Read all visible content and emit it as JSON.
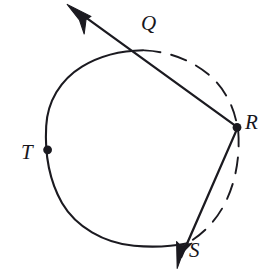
{
  "figure": {
    "name": "circle-with-two-secant-rays",
    "background_color": "#ffffff",
    "stroke_color": "#1b1a20",
    "labels": {
      "Q": "Q",
      "R": "R",
      "T": "T",
      "S": "S"
    },
    "points": [
      {
        "id": "Q",
        "label": "Q",
        "x": 143,
        "y": 51,
        "marked": false,
        "on_circle": true
      },
      {
        "id": "R",
        "label": "R",
        "x": 237,
        "y": 127,
        "marked": true,
        "on_circle": true
      },
      {
        "id": "T",
        "label": "T",
        "x": 48,
        "y": 150,
        "marked": true,
        "on_circle": true
      },
      {
        "id": "S",
        "label": "S",
        "x": 178,
        "y": 266,
        "marked": false,
        "on_circle": false
      }
    ],
    "circle": {
      "center_x": 143,
      "center_y": 147,
      "radius": 97,
      "solid_arc": "major arc from Q counterclockwise through T to the lower-right intersection",
      "dashed_arc": "minor arc from Q clockwise through R to the lower-right intersection"
    },
    "rays": [
      {
        "id": "ray-QR",
        "from_label": "R",
        "through_label": "Q",
        "arrow_at": "upper-left",
        "arrow_tip_x": 68,
        "arrow_tip_y": 5,
        "style": "solid"
      },
      {
        "id": "ray-RS",
        "from_label": "R",
        "through_label": "S",
        "arrow_at": "lower-left",
        "arrow_tip_x": 178,
        "arrow_tip_y": 266,
        "style": "solid"
      }
    ]
  }
}
